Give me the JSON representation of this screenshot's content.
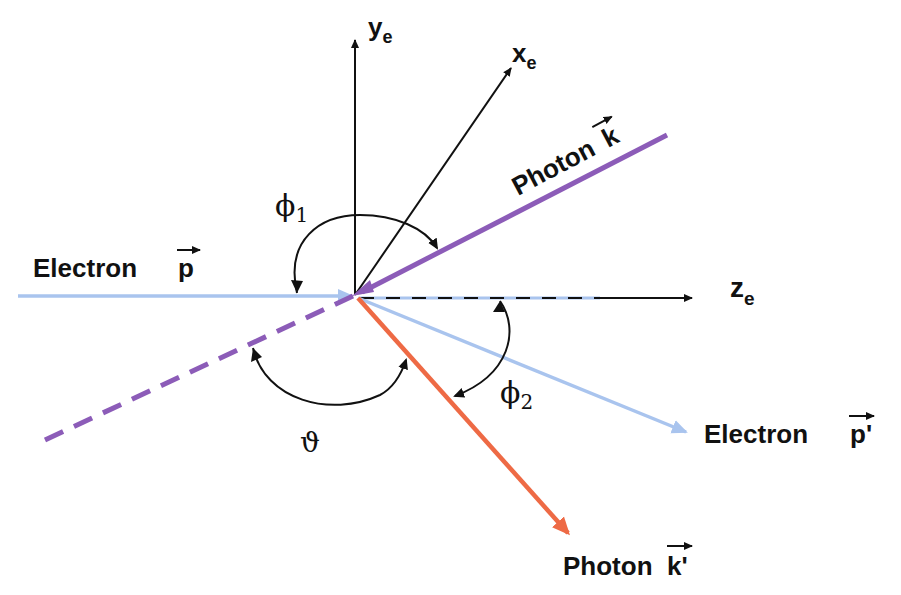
{
  "diagram": {
    "colors": {
      "axis": "#111111",
      "electron": "#a9c4ee",
      "photon_in": "#8c5cb8",
      "photon_out": "#ee6a45",
      "background": "#ffffff"
    },
    "axes": {
      "y": {
        "label": "y",
        "subscript": "e"
      },
      "x": {
        "label": "x",
        "subscript": "e"
      },
      "z": {
        "label": "z",
        "subscript": "e"
      }
    },
    "particles": {
      "electron_in": {
        "label": "Electron",
        "vector": "p",
        "prime": ""
      },
      "photon_in": {
        "label": "Photon",
        "vector": "k",
        "prime": ""
      },
      "electron_out": {
        "label": "Electron",
        "vector": "p",
        "prime": "'"
      },
      "photon_out": {
        "label": "Photon",
        "vector": "k",
        "prime": "'"
      }
    },
    "angles": {
      "phi1": {
        "symbol": "ϕ",
        "subscript": "1"
      },
      "phi2": {
        "symbol": "ϕ",
        "subscript": "2"
      },
      "theta": {
        "symbol": "ϑ"
      }
    }
  }
}
